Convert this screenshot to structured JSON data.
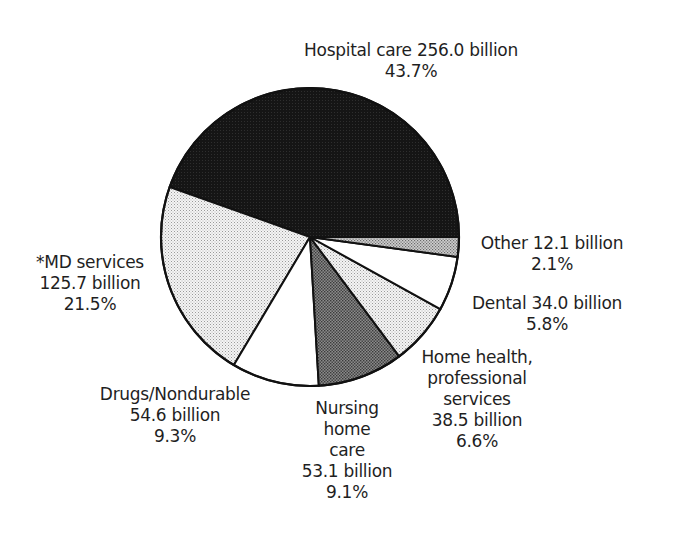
{
  "chart_data": {
    "type": "pie",
    "title": "",
    "start_angle_deg": 0,
    "direction": "counterclockwise",
    "unit": "billion",
    "slices": [
      {
        "label": "Hospital care",
        "value": 256.0,
        "percent": 43.7,
        "fill": "dark"
      },
      {
        "label": "*MD services",
        "value": 125.7,
        "percent": 21.5,
        "fill": "light-dots"
      },
      {
        "label": "Drugs/Nondurable",
        "value": 54.6,
        "percent": 9.3,
        "fill": "white"
      },
      {
        "label": "Nursing home care",
        "value": 53.1,
        "percent": 9.1,
        "fill": "dark-dots"
      },
      {
        "label": "Home health, professional services",
        "value": 38.5,
        "percent": 6.6,
        "fill": "light-dots"
      },
      {
        "label": "Dental",
        "value": 34.0,
        "percent": 5.8,
        "fill": "white"
      },
      {
        "label": "Other",
        "value": 12.1,
        "percent": 2.1,
        "fill": "medium-dots"
      }
    ],
    "legend": "none (direct labels)"
  },
  "labels": {
    "hospital": {
      "line1": "Hospital care 256.0 billion",
      "line2": "43.7%"
    },
    "md": {
      "line1": "*MD services",
      "line2": "125.7 billion",
      "line3": "21.5%"
    },
    "drugs": {
      "line1": "Drugs/Nondurable",
      "line2": "54.6 billion",
      "line3": "9.3%"
    },
    "nursing": {
      "line1": "Nursing",
      "line2": "home",
      "line3": "care",
      "line4": "53.1 billion",
      "line5": "9.1%"
    },
    "home_health": {
      "line1": "Home health,",
      "line2": "professional",
      "line3": "services",
      "line4": "38.5 billion",
      "line5": "6.6%"
    },
    "dental": {
      "line1": "Dental 34.0 billion",
      "line2": "5.8%"
    },
    "other": {
      "line1": "Other 12.1 billion",
      "line2": "2.1%"
    }
  },
  "colors": {
    "outline": "#111111",
    "background": "#ffffff"
  }
}
